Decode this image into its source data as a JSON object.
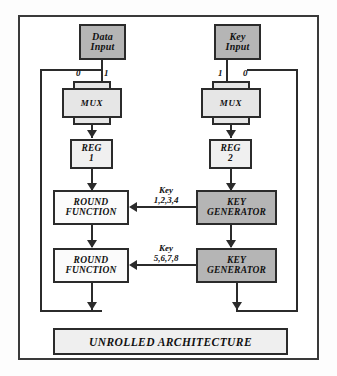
{
  "diagram": {
    "banner_label": "UNROLLED ARCHITECTURE",
    "colors": {
      "shaded_fill": "#b5b5b5",
      "light_fill": "#f0f0f0",
      "white_fill": "#fbfbfb",
      "mux_fill": "#e6e6e6",
      "line": "#2b2b2b",
      "frame": "#3a3a3a",
      "banner_fill": "#efefef",
      "background": "#ffffff"
    },
    "datapath": {
      "name": "data-path",
      "input": {
        "line1": "Data",
        "line2": "Input"
      },
      "mux": {
        "label": "MUX",
        "select_left": "0",
        "select_right": "1"
      },
      "reg": {
        "label": "REG",
        "index": "1"
      },
      "stages": [
        {
          "line1": "ROUND",
          "line2": "FUNCTION"
        },
        {
          "line1": "ROUND",
          "line2": "FUNCTION"
        }
      ]
    },
    "keypath": {
      "name": "key-path",
      "input": {
        "line1": "Key",
        "line2": "Input"
      },
      "mux": {
        "label": "MUX",
        "select_left": "1",
        "select_right": "0"
      },
      "reg": {
        "label": "REG",
        "index": "2"
      },
      "stages": [
        {
          "line1": "KEY",
          "line2": "GENERATOR"
        },
        {
          "line1": "KEY",
          "line2": "GENERATOR"
        }
      ]
    },
    "key_signals": [
      {
        "word": "Key",
        "numbers": "1,2,3,4"
      },
      {
        "word": "Key",
        "numbers": "5,6,7,8"
      }
    ]
  }
}
